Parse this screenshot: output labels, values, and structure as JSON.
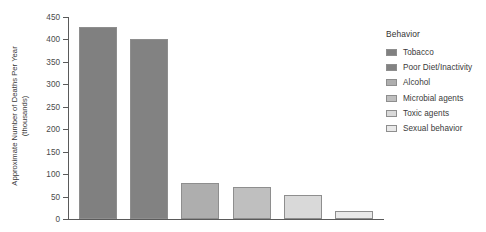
{
  "chart_data": {
    "type": "bar",
    "title": "",
    "xlabel": "",
    "ylabel": "Approximate Number of Deaths Per Year (thousands)",
    "ylabel_line1": "Approximate Number of Deaths Per Year",
    "ylabel_line2": "(thousands)",
    "ylim": [
      0,
      450
    ],
    "yticks": [
      0,
      50,
      100,
      150,
      200,
      250,
      300,
      350,
      400,
      450
    ],
    "ytick_labels": [
      "0",
      "50",
      "100",
      "150",
      "200",
      "250",
      "300",
      "350",
      "400",
      "450"
    ],
    "grid": false,
    "legend_position": "right",
    "legend_title": "Behavior",
    "categories": [
      "Tobacco",
      "Poor Diet/Inactivity",
      "Alcohol",
      "Microbial agents",
      "Toxic agents",
      "Sexual behavior"
    ],
    "values": [
      428,
      400,
      80,
      71,
      54,
      18
    ],
    "colors": [
      "#808080",
      "#828282",
      "#aeaeae",
      "#bfbfbf",
      "#d9d9d9",
      "#e9e9e9"
    ],
    "bar_edge_color": "#8e8e8e",
    "axis_color": "#5a5a5a"
  },
  "legend": {
    "title": "Behavior",
    "items": [
      {
        "label": "Tobacco",
        "color": "#808080"
      },
      {
        "label": "Poor Diet/Inactivity",
        "color": "#828282"
      },
      {
        "label": "Alcohol",
        "color": "#aeaeae"
      },
      {
        "label": "Microbial agents",
        "color": "#bfbfbf"
      },
      {
        "label": "Toxic agents",
        "color": "#d9d9d9"
      },
      {
        "label": "Sexual behavior",
        "color": "#e9e9e9"
      }
    ]
  }
}
